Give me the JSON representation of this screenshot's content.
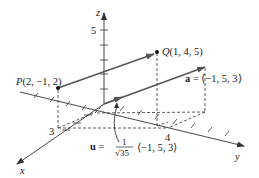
{
  "figure": {
    "axes": {
      "x_label": "x",
      "y_label": "y",
      "z_label": "z",
      "x_tick_label": "3",
      "y_tick_label": "4",
      "z_tick_label": "5"
    },
    "points": {
      "P": {
        "label": "P(2, −1, 2)",
        "coords": [
          2,
          -1,
          2
        ]
      },
      "Q": {
        "label": "Q(1, 4, 5)",
        "coords": [
          1,
          4,
          5
        ]
      }
    },
    "vectors": {
      "a": {
        "name": "a",
        "eq": " = ⟨−1, 5, 3⟩",
        "components": [
          -1,
          5,
          3
        ]
      },
      "u": {
        "name": "u",
        "eq": " = ",
        "numerator": "1",
        "denominator": "√35",
        "tail": "⟨−1, 5, 3⟩"
      }
    },
    "colors": {
      "vector": "#555555",
      "axis": "#333333",
      "background": "#ffffff"
    }
  }
}
